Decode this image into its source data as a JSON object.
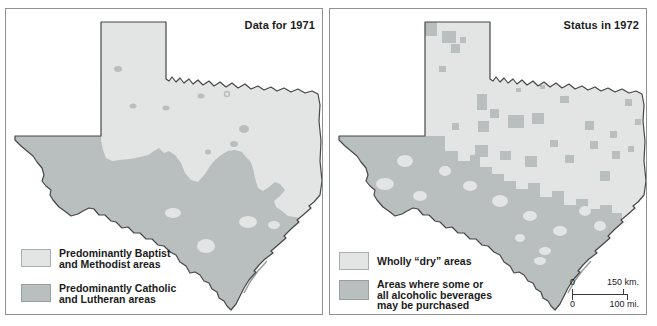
{
  "panels": [
    {
      "title": "Data for 1971",
      "legend": [
        {
          "swatch": "light",
          "label_lines": [
            "Predominantly Baptist",
            "and Methodist areas"
          ]
        },
        {
          "swatch": "dark",
          "label_lines": [
            "Predominantly Catholic",
            "and Lutheran areas"
          ]
        }
      ]
    },
    {
      "title": "Status in 1972",
      "legend": [
        {
          "swatch": "light",
          "label_lines": [
            "Wholly “dry” areas"
          ]
        },
        {
          "swatch": "dark",
          "label_lines": [
            "Areas where some or",
            "all alcoholic beverages",
            "may be purchased"
          ]
        }
      ],
      "scale_bar": {
        "zero_top": "0",
        "top_label": "150 km.",
        "zero_bottom": "0",
        "bottom_label": "100 mi."
      }
    }
  ],
  "colors": {
    "light_area": "#e2e5e3",
    "dark_area": "#b9bebe",
    "state_outline": "#474747",
    "panel_border": "#8e9292",
    "text": "#1b1b1b"
  }
}
